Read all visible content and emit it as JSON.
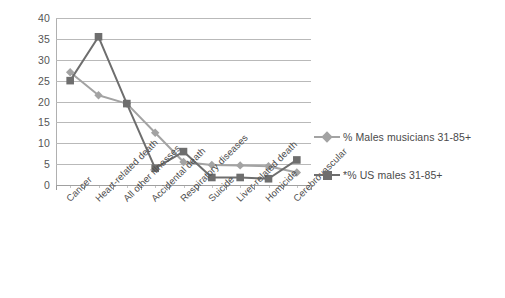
{
  "chart_data": {
    "type": "line",
    "title": "",
    "subtitle": "",
    "xlabel": "",
    "ylabel": "",
    "ylim": [
      0,
      40
    ],
    "ytick_step": 5,
    "yticks": [
      "40",
      "35",
      "30",
      "25",
      "20",
      "15",
      "10",
      "5",
      "0"
    ],
    "grid": true,
    "legend_position": "right",
    "categories": [
      "Cancer",
      "Heart-related death",
      "All other illnesses",
      "Accidental death",
      "Respiratory diseases",
      "Suicide",
      "Liver-related death",
      "Homicide",
      "Cerebrovascular"
    ],
    "series": [
      {
        "name": "% Males musicians 31-85+",
        "marker": "diamond",
        "color": "#a3a3a3",
        "values": [
          27,
          21.5,
          19.5,
          12.5,
          5.5,
          4.8,
          4.7,
          4.5,
          3
        ]
      },
      {
        "name": "*% US males 31-85+",
        "marker": "square",
        "color": "#6e6e6e",
        "values": [
          25,
          35.5,
          19.5,
          4,
          8,
          1.8,
          1.8,
          1.5,
          6
        ]
      }
    ]
  },
  "legend": {
    "entries": [
      {
        "label": "% Males musicians 31-85+"
      },
      {
        "label": "*% US males 31-85+"
      }
    ]
  },
  "colors": {
    "series_musicians": "#a3a3a3",
    "series_us_males": "#6e6e6e",
    "gridline": "#b9b9b9",
    "text": "#4e4e4e",
    "background": "#ffffff"
  }
}
